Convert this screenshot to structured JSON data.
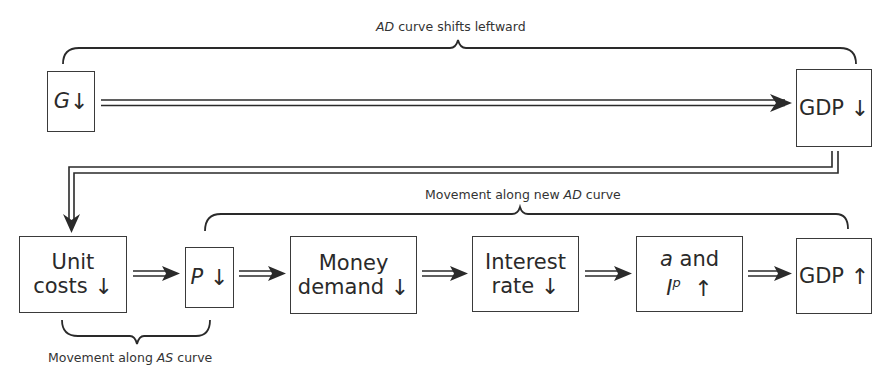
{
  "diagram": {
    "top_label": {
      "italic": "AD",
      "rest": " curve shifts leftward"
    },
    "middle_label": {
      "prefix": "Movement along new ",
      "italic": "AD",
      "suffix": " curve"
    },
    "bottom_label": {
      "prefix": "Movement along ",
      "italic": "AS",
      "suffix": " curve"
    },
    "boxes": {
      "g": {
        "var": "G",
        "arrow": "↓"
      },
      "gdp_down": {
        "text": "GDP",
        "arrow": "↓"
      },
      "unit_costs": {
        "line1": "Unit",
        "line2": "costs",
        "arrow": "↓"
      },
      "price": {
        "var": "P",
        "arrow": "↓"
      },
      "money_demand": {
        "line1": "Money",
        "line2": "demand",
        "arrow": "↓"
      },
      "interest_rate": {
        "line1": "Interest",
        "line2": "rate",
        "arrow": "↓"
      },
      "a_and_ip": {
        "var_a": "a",
        "and": " and",
        "var_i": "I",
        "sup": "p",
        "arrow": "↑"
      },
      "gdp_up": {
        "text": "GDP",
        "arrow": "↑"
      }
    },
    "colors": {
      "line": "#2a2a2a",
      "text": "#333333",
      "background": "#ffffff"
    }
  }
}
